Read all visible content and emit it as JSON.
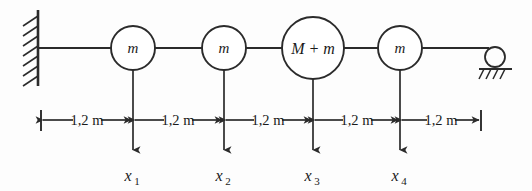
{
  "figure": {
    "background_color": "#fdfdfd",
    "line_color": "#2b2b2b",
    "masses": [
      {
        "id": "mass-1",
        "label": "m",
        "cx": 133,
        "cy": 48,
        "r": 22,
        "size": "small"
      },
      {
        "id": "mass-2",
        "label": "m",
        "cx": 224,
        "cy": 48,
        "r": 22,
        "size": "small"
      },
      {
        "id": "mass-3",
        "label": "M + m",
        "cx": 313,
        "cy": 48,
        "r": 31,
        "size": "large"
      },
      {
        "id": "mass-4",
        "label": "m",
        "cx": 400,
        "cy": 48,
        "r": 22,
        "size": "small"
      }
    ],
    "supports": [
      {
        "id": "wall-support",
        "type": "fixed-wall",
        "x": 38,
        "y_top": 10,
        "y_bottom": 86
      },
      {
        "id": "roller-support",
        "type": "roller",
        "cx": 495,
        "cy": 57,
        "r": 10
      }
    ],
    "dimensions": [
      {
        "id": "dim-1",
        "label": "1,2 m",
        "from": 41,
        "to": 133
      },
      {
        "id": "dim-2",
        "label": "1,2 m",
        "from": 133,
        "to": 224
      },
      {
        "id": "dim-3",
        "label": "1,2 m",
        "from": 224,
        "to": 313
      },
      {
        "id": "dim-4",
        "label": "1,2 m",
        "from": 313,
        "to": 400
      },
      {
        "id": "dim-5",
        "label": "1,2 m",
        "from": 400,
        "to": 481
      }
    ],
    "dimension_line_y": 120,
    "coordinates": [
      {
        "id": "coord-x1",
        "symbol": "x",
        "subscript": "1",
        "x": 133
      },
      {
        "id": "coord-x2",
        "symbol": "x",
        "subscript": "2",
        "x": 224
      },
      {
        "id": "coord-x3",
        "symbol": "x",
        "subscript": "3",
        "x": 313
      },
      {
        "id": "coord-x4",
        "symbol": "x",
        "subscript": "4",
        "x": 400
      }
    ],
    "coordinate_arrow_tip_y": 157,
    "coordinate_label_y": 180,
    "beam": {
      "y": 48,
      "x_start": 38,
      "x_end": 489
    }
  }
}
